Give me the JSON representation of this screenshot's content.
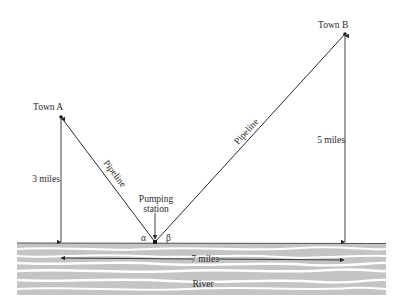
{
  "diagram": {
    "town_a": {
      "label": "Town A",
      "height_label": "3 miles"
    },
    "town_b": {
      "label": "Town B",
      "height_label": "5 miles"
    },
    "pumping_station": {
      "line1": "Pumping",
      "line2": "station"
    },
    "pipeline_left_label": "Pipeline",
    "pipeline_right_label": "Pipeline",
    "angle_alpha": "α",
    "angle_beta": "β",
    "distance_label": "7 miles",
    "river_label": "River",
    "colors": {
      "line": "#2a2a2a",
      "river": "#bdbdbd",
      "river_highlight": "#ffffff"
    }
  }
}
